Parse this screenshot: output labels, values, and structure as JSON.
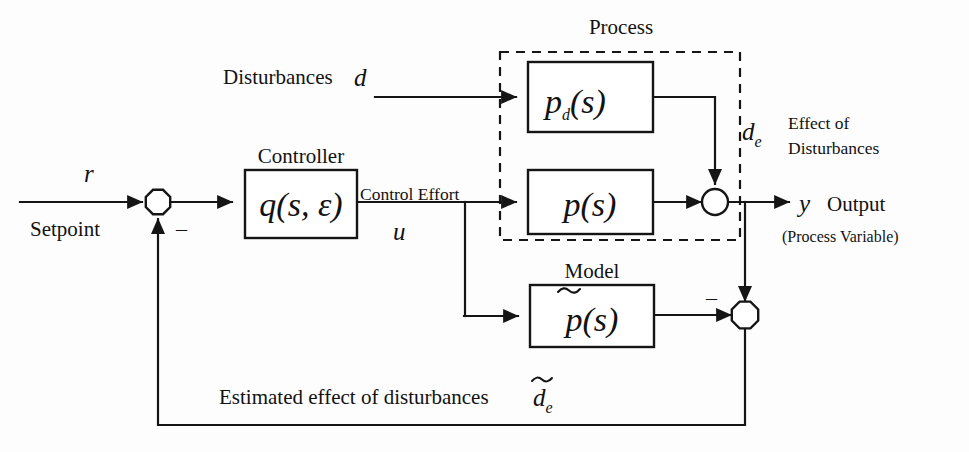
{
  "diagram": {
    "type": "control-system-block-diagram",
    "colors": {
      "line": "#151515",
      "background": "#ffffff",
      "text": "#121212"
    },
    "blocks": [
      {
        "id": "controller",
        "caption": "Controller",
        "expr": "q(s,ε)",
        "expr_fn": "q",
        "expr_args": "(s, ε)",
        "x": 245,
        "y": 170,
        "w": 112,
        "h": 68
      },
      {
        "id": "disturbance-plant",
        "caption": "",
        "expr": "p_d(s)",
        "expr_fn": "p",
        "expr_sub": "d",
        "expr_args": "(s)",
        "x": 528,
        "y": 62,
        "w": 125,
        "h": 70
      },
      {
        "id": "plant",
        "caption": "",
        "expr": "p(s)",
        "expr_fn": "p",
        "expr_args": "(s)",
        "x": 528,
        "y": 170,
        "w": 125,
        "h": 64
      },
      {
        "id": "model",
        "caption": "Model",
        "expr": "̃p(s)",
        "expr_fn": "p",
        "expr_args": "(s)",
        "x": 530,
        "y": 285,
        "w": 124,
        "h": 62
      }
    ],
    "groups": [
      {
        "id": "process",
        "caption": "Process",
        "caption_x": 621,
        "caption_y": 34,
        "x": 500,
        "y": 52,
        "w": 240,
        "h": 188
      }
    ],
    "junctions": [
      {
        "id": "error-sum",
        "shape": "octagon",
        "cx": 158,
        "cy": 202,
        "r": 12.5
      },
      {
        "id": "output-sum",
        "shape": "circle",
        "cx": 715,
        "cy": 202,
        "r": 13
      },
      {
        "id": "disturbance-estimate-sum",
        "shape": "octagon",
        "cx": 745,
        "cy": 315,
        "r": 13.5
      }
    ],
    "signals": [
      {
        "id": "setpoint-symbol",
        "text": "r",
        "x": 84,
        "y": 182,
        "style": "math-var"
      },
      {
        "id": "setpoint-name",
        "text": "Setpoint",
        "x": 30,
        "y": 236,
        "style": "lbl"
      },
      {
        "id": "error-sum-minus",
        "text": "–",
        "x": 176,
        "y": 236,
        "style": "sign"
      },
      {
        "id": "disturbances-name",
        "text": "Disturbances",
        "x": 223,
        "y": 84,
        "style": "lbl"
      },
      {
        "id": "disturbances-symbol",
        "text": "d",
        "x": 354,
        "y": 86,
        "style": "math-var"
      },
      {
        "id": "control-effort-name",
        "text": "Control Effort",
        "x": 360,
        "y": 200,
        "style": "lbl-small"
      },
      {
        "id": "control-effort-symbol",
        "text": "u",
        "x": 393,
        "y": 240,
        "style": "math-var"
      },
      {
        "id": "disturbance-effect-symbol",
        "text": "d",
        "x": 742,
        "y": 140,
        "style": "math-var"
      },
      {
        "id": "disturbance-effect-sub",
        "text": "e",
        "x": 757,
        "y": 147,
        "style": "math-sub"
      },
      {
        "id": "disturbance-effect-line1",
        "text": "Effect of",
        "x": 788,
        "y": 129,
        "style": "lbl-small"
      },
      {
        "id": "disturbance-effect-line2",
        "text": "Disturbances",
        "x": 788,
        "y": 154,
        "style": "lbl-small"
      },
      {
        "id": "output-symbol",
        "text": "y",
        "x": 799,
        "y": 212,
        "style": "math-var"
      },
      {
        "id": "output-name",
        "text": "Output",
        "x": 827,
        "y": 211,
        "style": "lbl"
      },
      {
        "id": "output-subtitle",
        "text": "(Process Variable)",
        "x": 782,
        "y": 242,
        "style": "lbl-tiny"
      },
      {
        "id": "model-sum-minus",
        "text": "–",
        "x": 706,
        "y": 305,
        "style": "sign"
      },
      {
        "id": "estimated-effect-name",
        "text": "Estimated effect of disturbances",
        "x": 219,
        "y": 404,
        "style": "lbl"
      },
      {
        "id": "estimated-effect-symbol",
        "text": "d",
        "x": 533,
        "y": 406,
        "style": "math-var"
      },
      {
        "id": "estimated-effect-sub",
        "text": "e",
        "x": 548,
        "y": 413,
        "style": "math-sub"
      }
    ]
  }
}
